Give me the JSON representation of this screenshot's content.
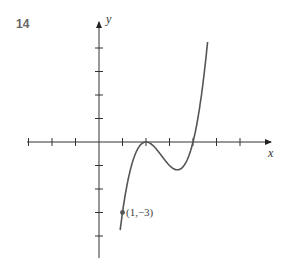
{
  "figure": {
    "number": "14"
  },
  "chart_data": {
    "type": "line",
    "title": "",
    "xlabel": "x",
    "ylabel": "y",
    "function": "y = (x-2)^2 (x-4)",
    "x_ticks": [
      -3,
      -2,
      -1,
      1,
      2,
      3,
      4,
      5,
      6
    ],
    "y_ticks": [
      -5,
      -4,
      -3,
      -2,
      -1,
      1,
      2,
      3,
      4
    ],
    "xlim": [
      -4,
      7
    ],
    "ylim": [
      -5,
      5
    ],
    "grid": false,
    "series": [
      {
        "name": "curve",
        "x": [
          0.9,
          1,
          1.5,
          2,
          2.5,
          3,
          3.33,
          3.5,
          4,
          4.3,
          4.6
        ],
        "y": [
          -3.79,
          -3,
          -0.63,
          0,
          -0.38,
          -1,
          -1.19,
          -1.13,
          0,
          1.53,
          3.9
        ]
      }
    ],
    "annotations": [
      {
        "point": [
          1,
          -3
        ],
        "label": "(1, −3)"
      }
    ]
  },
  "labels": {
    "x_axis": "x",
    "y_axis": "y",
    "point": "(1,−3)"
  }
}
